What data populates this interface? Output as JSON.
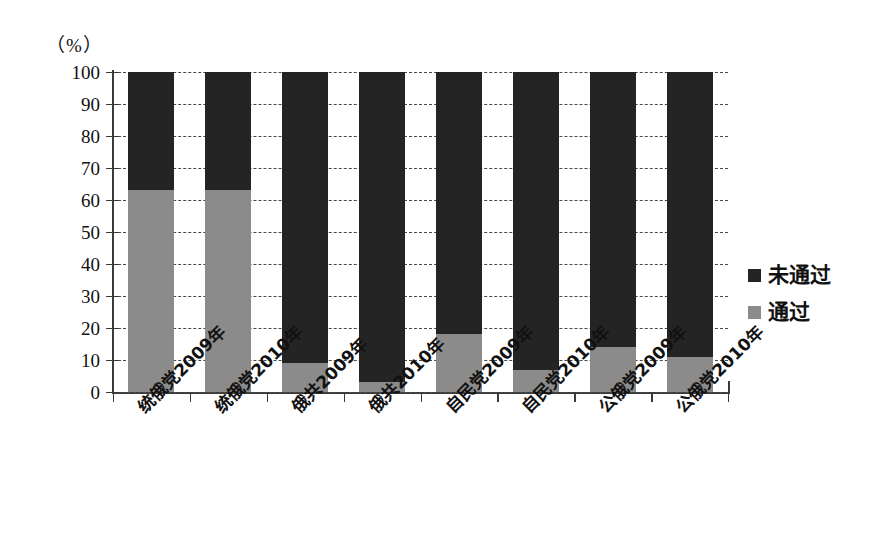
{
  "chart_data": {
    "type": "bar",
    "subtype": "stacked-bar-100-percent",
    "title": "",
    "subtitle": "",
    "unit_label": "（%）",
    "xlabel": "",
    "ylabel": "",
    "ylim": [
      0,
      100
    ],
    "ytick_step": 10,
    "ytick_labels": [
      "100",
      "90",
      "80",
      "70",
      "60",
      "50",
      "40",
      "30",
      "20",
      "10",
      "0"
    ],
    "ytick_values": [
      100,
      90,
      80,
      70,
      60,
      50,
      40,
      30,
      20,
      10,
      0
    ],
    "grid": true,
    "grid_style": "dashed",
    "grid_axis": "y",
    "legend_position": "right",
    "categories": [
      "统俄党2009年",
      "统俄党2010年",
      "俄共2009年",
      "俄共2010年",
      "自民党2009年",
      "自民党2010年",
      "公俄党2009年",
      "公俄党2010年"
    ],
    "series": [
      {
        "name": "未通过",
        "color": "#242424",
        "values": [
          37,
          37,
          91,
          97,
          82,
          93,
          86,
          89
        ]
      },
      {
        "name": "通过",
        "color": "#8b8b8b",
        "values": [
          63,
          63,
          9,
          3,
          18,
          7,
          14,
          11
        ]
      }
    ]
  },
  "legend": {
    "items": [
      {
        "label": "未通过",
        "color": "#242424",
        "swatch": "square-dark"
      },
      {
        "label": "通过",
        "color": "#8b8b8b",
        "swatch": "square-gray"
      }
    ]
  }
}
